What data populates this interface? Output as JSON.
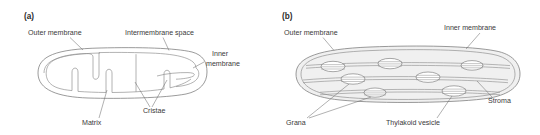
{
  "figure": {
    "type": "biology-diagram",
    "background_color": "#ffffff",
    "line_color": "#7a7a7a",
    "text_color": "#3a3a3a",
    "fill_color": "#f0f0f0"
  },
  "panel_a": {
    "panel_label": "(a)",
    "subject": "mitochondrion",
    "labels": {
      "outer_membrane": "Outer membrane",
      "intermembrane_space": "Intermembrane space",
      "inner_membrane_line1": "Inner",
      "inner_membrane_line2": "membrane",
      "cristae": "Cristae",
      "matrix": "Matrix"
    }
  },
  "panel_b": {
    "panel_label": "(b)",
    "subject": "chloroplast",
    "labels": {
      "outer_membrane": "Outer membrane",
      "inner_membrane": "Inner membrane",
      "stroma": "Stroma",
      "grana": "Grana",
      "thylakoid_vesicle": "Thylakoid vesicle"
    }
  }
}
